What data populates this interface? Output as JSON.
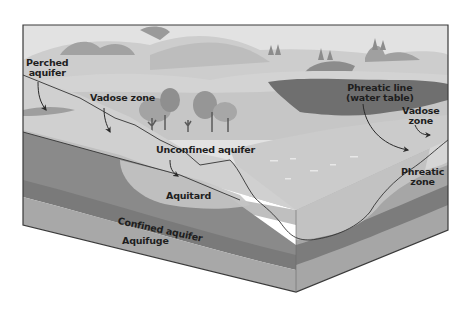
{
  "diagram": {
    "type": "cross-section block diagram",
    "labels": {
      "perched_aquifer": "Perched\naquifer",
      "perched_aquifer_line1": "Perched",
      "perched_aquifer_line2": "aquifer",
      "vadose_zone_left": "Vadose zone",
      "unconfined_aquifer": "Unconfined aquifer",
      "aquitard": "Aquitard",
      "confined_aquifer": "Confined aquifer",
      "aquifuge": "Aquifuge",
      "phreatic_line_line1": "Phreatic line",
      "phreatic_line_line2": "(water table)",
      "vadose_zone_right_line1": "Vadose",
      "vadose_zone_right_line2": "zone",
      "phreatic_zone_line1": "Phreatic",
      "phreatic_zone_line2": "zone"
    },
    "colors": {
      "outline": "#3a3a3a",
      "sky": "#e4e4e4",
      "hills_light": "#cfcfcf",
      "hills_mid": "#b9b9b9",
      "trees": "#8e8e8e",
      "vadose": "#c8c8c8",
      "unconfined": "#d6d6d6",
      "water_surface": "#c4c4c4",
      "aquitard": "#8a8a8a",
      "confined": "#7a7a7a",
      "aquifuge": "#a6a6a6",
      "dark_pool": "#6f6f6f",
      "text": "#1e1e1e"
    }
  }
}
